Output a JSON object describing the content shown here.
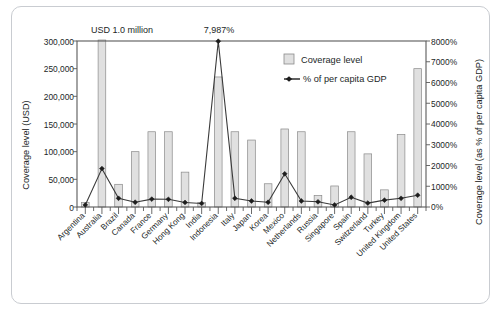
{
  "figure": {
    "annotations": [
      {
        "name": "australia-value-callout",
        "text": "USD 1.0 million"
      },
      {
        "name": "indonesia-peak-callout",
        "text": "7,987%"
      }
    ],
    "legend": {
      "position": "top-right",
      "entries": [
        {
          "label": "Coverage level",
          "marker": "bar-swatch",
          "color": "#e0e0e0"
        },
        {
          "label": "% of per capita GDP",
          "marker": "line-with-point",
          "color": "#1d1d1d"
        }
      ]
    }
  },
  "chart_data": {
    "type": "bar",
    "title": "",
    "xlabel": "",
    "ylabel": "Coverage level (USD)",
    "y2label": "Coverage level (as % of per capita GDP)",
    "ylim": [
      0,
      300000
    ],
    "y2lim": [
      0,
      8000
    ],
    "grid": false,
    "y_ticks": [
      0,
      50000,
      100000,
      150000,
      200000,
      250000,
      300000
    ],
    "y_tick_labels": [
      "0",
      "50,000",
      "100,000",
      "150,000",
      "200,000",
      "250,000",
      "300,000"
    ],
    "y2_ticks": [
      0,
      1000,
      2000,
      3000,
      4000,
      5000,
      6000,
      7000,
      8000
    ],
    "y2_tick_labels": [
      "0%",
      "1000%",
      "2000%",
      "3000%",
      "4000%",
      "5000%",
      "6000%",
      "7000%",
      "8000%"
    ],
    "categories": [
      "Argentina",
      "Australia",
      "Brazil",
      "Canada",
      "France",
      "Germany",
      "Hong Kong",
      "India",
      "Indonesia",
      "Italy",
      "Japan",
      "Korea",
      "Mexico",
      "Netherlands",
      "Russia",
      "Singapore",
      "Spain",
      "Switzerland",
      "Turkey",
      "United Kingdom",
      "United States"
    ],
    "series": [
      {
        "name": "Coverage level",
        "unit": "USD",
        "axis": "left",
        "type": "bar",
        "values": [
          8000,
          1000000,
          41000,
          100000,
          136000,
          136000,
          63000,
          8000,
          235000,
          136000,
          121000,
          42000,
          141000,
          136000,
          21000,
          38000,
          136000,
          96000,
          31000,
          131000,
          250000
        ],
        "clipped": [
          "Australia"
        ]
      },
      {
        "name": "% of per capita GDP",
        "unit": "%",
        "axis": "right",
        "type": "line",
        "values": [
          100,
          1850,
          420,
          230,
          380,
          370,
          220,
          170,
          7987,
          420,
          290,
          230,
          1600,
          290,
          250,
          100,
          470,
          190,
          330,
          420,
          570
        ]
      }
    ]
  }
}
